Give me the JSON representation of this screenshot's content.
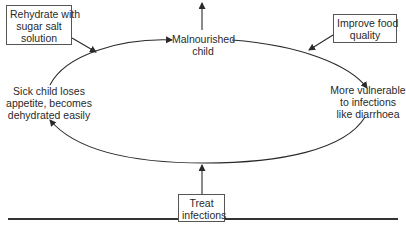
{
  "diagram": {
    "type": "cycle",
    "cycle_nodes": [
      {
        "id": "malnourished",
        "text": "Malnourished child"
      },
      {
        "id": "vulnerable",
        "text": "More vulnerable to infections like diarrhoea"
      },
      {
        "id": "sick",
        "text": "Sick child loses appetite, becomes dehydrated easily"
      }
    ],
    "interventions": [
      {
        "id": "rehydrate",
        "text": "Rehydrate with sugar salt solution",
        "targets": "cycle-left-upper"
      },
      {
        "id": "food",
        "text": "Improve food quality",
        "targets": "cycle-right-upper"
      },
      {
        "id": "treat",
        "text": "Treat infections",
        "targets": "cycle-bottom"
      }
    ],
    "labels": {
      "malnourished_l1": "Malnourished",
      "malnourished_l2": "child",
      "vulnerable_l1": "More vulnerable",
      "vulnerable_l2": "to infections",
      "vulnerable_l3": "like diarrhoea",
      "sick_l1": "Sick child loses",
      "sick_l2": "appetite, becomes",
      "sick_l3": "dehydrated easily",
      "rehydrate_l1": "Rehydrate with",
      "rehydrate_l2": "sugar salt",
      "rehydrate_l3": "solution",
      "food_l1": "Improve food",
      "food_l2": "quality",
      "treat_l1": "Treat",
      "treat_l2": "infections"
    },
    "colors": {
      "line": "#2a2a2a",
      "text": "#2a2a2a",
      "background": "#ffffff"
    }
  }
}
